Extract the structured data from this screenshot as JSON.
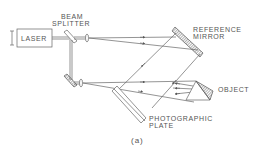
{
  "figure": {
    "caption": "(a)",
    "labels": {
      "laser": "LASER",
      "beam_splitter_line1": "BEAM",
      "beam_splitter_line2": "SPLITTER",
      "reference_mirror_line1": "REFERENCE",
      "reference_mirror_line2": "MIRROR",
      "object": "OBJECT",
      "photographic_plate_line1": "PHOTOGRAPHIC",
      "photographic_plate_line2": "PLATE"
    },
    "components": [
      "laser",
      "beam splitter",
      "lens",
      "reference mirror",
      "mirror",
      "lens",
      "photographic plate",
      "object"
    ],
    "colors": {
      "line": "#666666",
      "text": "#555555",
      "background": "#ffffff"
    }
  }
}
